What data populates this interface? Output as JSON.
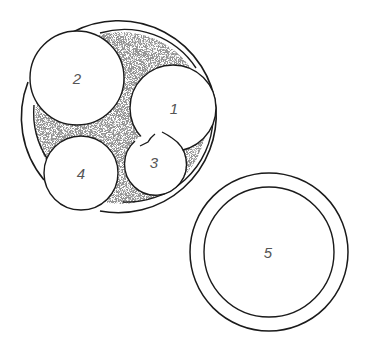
{
  "diagram": {
    "type": "circles-packing",
    "colors": {
      "stroke": "#1a1a1a",
      "stipple": "#6a6a6a",
      "background": "#ffffff",
      "label": "#555555"
    },
    "container": {
      "description": "large outer ring with stippled interior holding circles 1-4",
      "center": [
        120,
        116
      ],
      "outer_radius": 98,
      "inner_radius": 86
    },
    "circles": [
      {
        "id": "c1",
        "label": "1",
        "cx": 173,
        "cy": 108,
        "r": 43
      },
      {
        "id": "c2",
        "label": "2",
        "cx": 77,
        "cy": 78,
        "r": 47
      },
      {
        "id": "c3",
        "label": "3",
        "cx": 155,
        "cy": 164,
        "r": 31
      },
      {
        "id": "c4",
        "label": "4",
        "cx": 81,
        "cy": 173,
        "r": 37
      }
    ],
    "separate": {
      "label": "5",
      "cx": 269,
      "cy": 252,
      "outer_r": 79,
      "inner_r": 65
    }
  }
}
